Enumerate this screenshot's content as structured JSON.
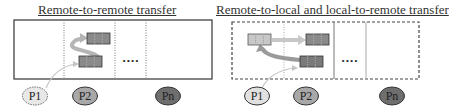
{
  "panels": [
    {
      "title": "Remote-to-remote transfer",
      "ellipsis": "....",
      "processes": [
        "P1",
        "P2",
        "Pn"
      ]
    },
    {
      "title": "Remote-to-local and local-to-remote transfer",
      "ellipsis": "....",
      "processes": [
        "P1",
        "P2",
        "Pn"
      ]
    }
  ],
  "colors": {
    "p1_fill": "#e8e8e8",
    "p2_fill": "#a8a8a8",
    "pn_fill": "#6e6e6e",
    "block_dark": "#8a8a8a",
    "block_light": "#c8c8c8",
    "arrow": "#b5b5b5",
    "border": "#333333"
  }
}
